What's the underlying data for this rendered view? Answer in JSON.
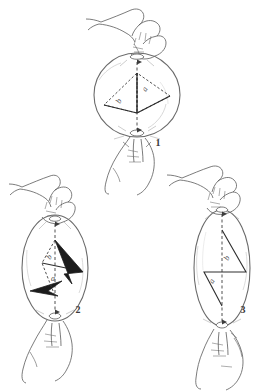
{
  "illustration": {
    "title": "Deformation of a spherical body by manual stretching",
    "style": "pen-and-ink line drawing",
    "background_color": "#ffffff",
    "ink_color": "#4a4a4a",
    "fill_color": "#1c1c1c"
  },
  "panels": [
    {
      "id": "panel-1",
      "number": "1",
      "number_pos": {
        "x": 158,
        "y": 146
      },
      "caption_state": "undeformed sphere held between thumb and forefinger",
      "body": {
        "shape": "circle",
        "cx": 137,
        "cy": 95,
        "rx": 43,
        "ry": 42
      },
      "axis": {
        "x": 137,
        "y1": 60,
        "y2": 132,
        "style": "dashed",
        "arrows": "both"
      },
      "labels": [
        {
          "text": "b",
          "x": 125,
          "y": 101
        },
        {
          "text": "a",
          "x": 149,
          "y": 89
        }
      ],
      "hands": [
        {
          "position": "top",
          "grip": "pinch-down"
        },
        {
          "position": "bottom",
          "grip": "pinch-up"
        }
      ]
    },
    {
      "id": "panel-2",
      "number": "2",
      "number_pos": {
        "x": 78,
        "y": 310
      },
      "caption_state": "moderately elongated ellipsoid with filled arrow vectors",
      "body": {
        "shape": "ellipse",
        "cx": 55,
        "cy": 268,
        "rx": 33,
        "ry": 53
      },
      "axis": {
        "x": 55,
        "y1": 222,
        "y2": 314,
        "style": "dashed",
        "arrows": "both"
      },
      "labels": [
        {
          "text": "b",
          "x": 53,
          "y": 258
        },
        {
          "text": "a",
          "x": 55,
          "y": 279
        }
      ],
      "hands": [
        {
          "position": "top",
          "grip": "pinch-down"
        },
        {
          "position": "bottom",
          "grip": "pinch-up"
        }
      ]
    },
    {
      "id": "panel-3",
      "number": "3",
      "number_pos": {
        "x": 243,
        "y": 310
      },
      "caption_state": "maximally elongated lens-shaped body",
      "body": {
        "shape": "ellipse",
        "cx": 222,
        "cy": 268,
        "rx": 28,
        "ry": 58
      },
      "axis": {
        "x": 222,
        "y1": 212,
        "y2": 322,
        "style": "dashed",
        "arrows": "both"
      },
      "labels": [
        {
          "text": "b",
          "x": 228,
          "y": 259
        },
        {
          "text": "a",
          "x": 218,
          "y": 282
        }
      ],
      "hands": [
        {
          "position": "top",
          "grip": "pinch-down"
        },
        {
          "position": "bottom",
          "grip": "pinch-up"
        }
      ]
    }
  ],
  "legend": {
    "axis_label_a": "a",
    "axis_label_b": "b"
  }
}
